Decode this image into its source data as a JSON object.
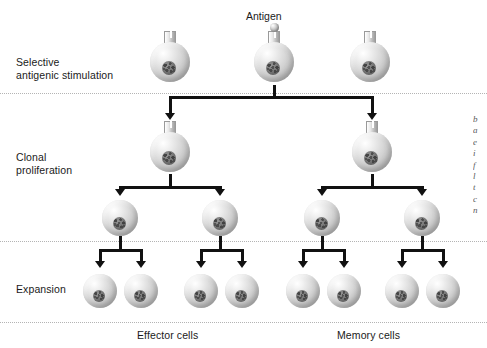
{
  "figure": {
    "background": "#ffffff",
    "line_color": "#111111",
    "divider_color": "#b4b4b4",
    "text_color": "#1a1a1a",
    "width": 487,
    "height": 348
  },
  "antigen": {
    "label": "Antigen"
  },
  "stages": [
    {
      "id": "selective-antigenic-stimulation",
      "label": "Selective\nantigenic stimulation",
      "x": 16,
      "y": 56
    },
    {
      "id": "clonal-proliferation",
      "label": "Clonal\nproliferation",
      "x": 16,
      "y": 151
    },
    {
      "id": "expansion",
      "label": "Expansion",
      "x": 16,
      "y": 283
    }
  ],
  "dividers": [
    {
      "id": "divider-stimulation",
      "y": 93
    },
    {
      "id": "divider-proliferation",
      "y": 241
    },
    {
      "id": "divider-expansion",
      "y": 322
    }
  ],
  "captions": [
    {
      "id": "effector-cells",
      "label": "Effector cells",
      "x": 137,
      "y": 329
    },
    {
      "id": "memory-cells",
      "label": "Memory cells",
      "x": 337,
      "y": 329
    }
  ],
  "rows": [
    {
      "id": "row-naive-lymphocytes",
      "name": "naive lymphocyte row",
      "diameter": 40,
      "cy": 62,
      "cells": [
        {
          "id": "naive-cell-left",
          "cx": 170,
          "receptor": true,
          "antigen": false
        },
        {
          "id": "naive-cell-center",
          "cx": 274,
          "receptor": true,
          "antigen": true
        },
        {
          "id": "naive-cell-right",
          "cx": 370,
          "receptor": true,
          "antigen": false
        }
      ]
    },
    {
      "id": "row-activated-clones",
      "name": "activated clone row",
      "diameter": 40,
      "cy": 152,
      "cells": [
        {
          "id": "clone-cell-left",
          "cx": 170,
          "receptor": true,
          "antigen": false
        },
        {
          "id": "clone-cell-right",
          "cx": 372,
          "receptor": true,
          "antigen": false
        }
      ]
    },
    {
      "id": "row-proliferating-cells",
      "name": "proliferating cell row",
      "diameter": 36,
      "cy": 218,
      "cells": [
        {
          "id": "prolif-cell-1",
          "cx": 120,
          "receptor": false,
          "antigen": false
        },
        {
          "id": "prolif-cell-2",
          "cx": 220,
          "receptor": false,
          "antigen": false
        },
        {
          "id": "prolif-cell-3",
          "cx": 322,
          "receptor": false,
          "antigen": false
        },
        {
          "id": "prolif-cell-4",
          "cx": 422,
          "receptor": false,
          "antigen": false
        }
      ]
    },
    {
      "id": "row-expanded-cells",
      "name": "expanded cell row",
      "diameter": 34,
      "cy": 291,
      "cells": [
        {
          "id": "effector-cell-1",
          "cx": 100,
          "receptor": false,
          "antigen": false
        },
        {
          "id": "effector-cell-2",
          "cx": 141,
          "receptor": false,
          "antigen": false
        },
        {
          "id": "effector-cell-3",
          "cx": 201,
          "receptor": false,
          "antigen": false
        },
        {
          "id": "effector-cell-4",
          "cx": 242,
          "receptor": false,
          "antigen": false
        },
        {
          "id": "memory-cell-1",
          "cx": 303,
          "receptor": false,
          "antigen": false
        },
        {
          "id": "memory-cell-2",
          "cx": 344,
          "receptor": false,
          "antigen": false
        },
        {
          "id": "memory-cell-3",
          "cx": 402,
          "receptor": false,
          "antigen": false
        },
        {
          "id": "memory-cell-4",
          "cx": 443,
          "receptor": false,
          "antigen": false
        }
      ]
    }
  ],
  "connectors": [
    {
      "id": "split-selection",
      "type": "fork",
      "from_x": 274,
      "top_y": 85,
      "bus_y": 97,
      "to_y": 120,
      "targets": [
        170,
        372
      ]
    },
    {
      "id": "split-clone-left",
      "type": "fork",
      "from_x": 170,
      "top_y": 174,
      "bus_y": 187,
      "to_y": 196,
      "targets": [
        120,
        220
      ]
    },
    {
      "id": "split-clone-right",
      "type": "fork",
      "from_x": 372,
      "top_y": 174,
      "bus_y": 187,
      "to_y": 196,
      "targets": [
        322,
        422
      ]
    },
    {
      "id": "split-prolif-1",
      "type": "fork",
      "from_x": 120,
      "top_y": 236,
      "bus_y": 250,
      "to_y": 268,
      "targets": [
        100,
        141
      ]
    },
    {
      "id": "split-prolif-2",
      "type": "fork",
      "from_x": 220,
      "top_y": 236,
      "bus_y": 250,
      "to_y": 268,
      "targets": [
        201,
        242
      ]
    },
    {
      "id": "split-prolif-3",
      "type": "fork",
      "from_x": 322,
      "top_y": 236,
      "bus_y": 250,
      "to_y": 268,
      "targets": [
        303,
        344
      ]
    },
    {
      "id": "split-prolif-4",
      "type": "fork",
      "from_x": 422,
      "top_y": 236,
      "bus_y": 250,
      "to_y": 268,
      "targets": [
        402,
        443
      ]
    }
  ],
  "edge_text": {
    "lines": [
      "b",
      "a",
      "e",
      "i",
      "f",
      "l",
      "t",
      "c",
      "n",
      "a",
      "s"
    ]
  }
}
